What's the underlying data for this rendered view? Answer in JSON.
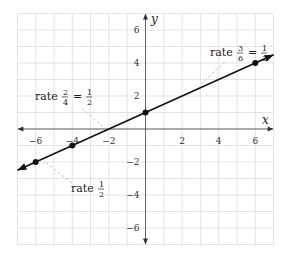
{
  "chart_data": {
    "type": "line",
    "title": "",
    "xlabel": "x",
    "ylabel": "y",
    "xlim": [
      -7,
      7
    ],
    "ylim": [
      -7,
      7
    ],
    "grid": true,
    "x_ticks": [
      -6,
      -4,
      -2,
      2,
      4,
      6
    ],
    "y_ticks": [
      6,
      4,
      2,
      -2,
      -4,
      -6
    ],
    "x_tick_labels": [
      "−6",
      "−4",
      "−2",
      "2",
      "4",
      "6"
    ],
    "y_tick_labels": [
      "6",
      "4",
      "2",
      "−2",
      "−4",
      "−6"
    ],
    "series": [
      {
        "name": "line",
        "equation": "y = x/2 + 1",
        "slope": 0.5,
        "intercept": 1,
        "x": [
          -7,
          7
        ],
        "y": [
          -2.5,
          4.5
        ],
        "arrows_both_ends": true
      }
    ],
    "points": [
      {
        "x": -6,
        "y": -2
      },
      {
        "x": -4,
        "y": -1
      },
      {
        "x": 0,
        "y": 1
      },
      {
        "x": 6,
        "y": 4
      }
    ],
    "annotations": [
      {
        "id": "ann1",
        "prefix": "rate",
        "num1": "2",
        "den1": "4",
        "eq": "=",
        "num2": "1",
        "den2": "2",
        "text": "rate 2/4 = 1/2"
      },
      {
        "id": "ann2",
        "prefix": "rate",
        "num1": "3",
        "den1": "6",
        "eq": "=",
        "num2": "1",
        "den2": "2",
        "text": "rate 3/6 = 1/2"
      },
      {
        "id": "ann3",
        "prefix": "rate",
        "num1": "1",
        "den1": "2",
        "text": "rate 1/2"
      }
    ],
    "colors": {
      "line": "#111111",
      "grid": "#d9d9d9",
      "axis": "#555555",
      "leader": "#bbbbbb"
    }
  }
}
